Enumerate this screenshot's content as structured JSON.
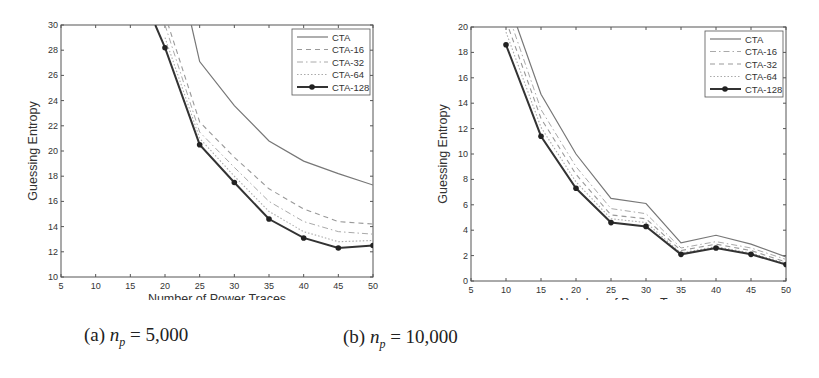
{
  "chart_data": [
    {
      "type": "line",
      "title": "",
      "caption": "(a) n_p = 5,000",
      "xlabel": "Number of Power Traces",
      "ylabel": "Guessing Entropy",
      "xlim": [
        5,
        50
      ],
      "ylim": [
        10,
        30
      ],
      "xticks": [
        5,
        10,
        15,
        20,
        25,
        30,
        35,
        40,
        45,
        50
      ],
      "yticks": [
        10,
        12,
        14,
        16,
        18,
        20,
        22,
        24,
        26,
        28,
        30
      ],
      "grid": false,
      "legend_position": "upper right",
      "x": [
        20,
        25,
        30,
        35,
        40,
        45,
        50
      ],
      "series": [
        {
          "name": "CTA",
          "style": "solid",
          "values": [
            null,
            27.1,
            23.6,
            20.8,
            19.2,
            18.2,
            17.3
          ],
          "entry": [
            23.8,
            30
          ]
        },
        {
          "name": "CTA-16",
          "style": "dashed",
          "values": [
            30.8,
            22.3,
            19.5,
            17.0,
            15.4,
            14.4,
            14.2
          ]
        },
        {
          "name": "CTA-32",
          "style": "dashdot",
          "values": [
            30.0,
            21.5,
            18.7,
            16.0,
            14.4,
            13.6,
            13.4
          ]
        },
        {
          "name": "CTA-64",
          "style": "dotted",
          "values": [
            29.0,
            21.0,
            18.0,
            15.2,
            13.6,
            12.8,
            12.9
          ]
        },
        {
          "name": "CTA-128",
          "style": "solid-marker",
          "values": [
            28.2,
            20.5,
            17.5,
            14.6,
            13.1,
            12.3,
            12.5
          ],
          "entry": [
            18.6,
            30
          ]
        }
      ]
    },
    {
      "type": "line",
      "title": "",
      "caption": "(b) n_p = 10,000",
      "xlabel": "Number of Power Traces",
      "ylabel": "Guessing Entropy",
      "xlim": [
        5,
        50
      ],
      "ylim": [
        0,
        20
      ],
      "xticks": [
        5,
        10,
        15,
        20,
        25,
        30,
        35,
        40,
        45,
        50
      ],
      "yticks": [
        0,
        2,
        4,
        6,
        8,
        10,
        12,
        14,
        16,
        18,
        20
      ],
      "grid": false,
      "legend_position": "upper right",
      "x": [
        10,
        15,
        20,
        25,
        30,
        35,
        40,
        45,
        50
      ],
      "series": [
        {
          "name": "CTA",
          "style": "solid",
          "values": [
            22.5,
            14.7,
            10.0,
            6.5,
            6.1,
            3.0,
            3.6,
            2.9,
            1.9
          ]
        },
        {
          "name": "CTA-16",
          "style": "dashdot",
          "values": [
            21.5,
            13.5,
            9.0,
            5.7,
            5.3,
            2.6,
            3.1,
            2.6,
            1.7
          ]
        },
        {
          "name": "CTA-32",
          "style": "dashed",
          "values": [
            20.5,
            12.8,
            8.4,
            5.2,
            4.9,
            2.4,
            2.9,
            2.4,
            1.5
          ]
        },
        {
          "name": "CTA-64",
          "style": "dotted",
          "values": [
            19.6,
            12.1,
            7.8,
            4.9,
            4.6,
            2.2,
            2.7,
            2.2,
            1.4
          ]
        },
        {
          "name": "CTA-128",
          "style": "solid-marker",
          "values": [
            18.6,
            11.4,
            7.3,
            4.6,
            4.3,
            2.1,
            2.6,
            2.1,
            1.3
          ]
        }
      ]
    }
  ],
  "panels": [
    {
      "caption_prefix": "(a) ",
      "caption_var": "n",
      "caption_sub": "p",
      "caption_rest": " = 5,000"
    },
    {
      "caption_prefix": "(b) ",
      "caption_var": "n",
      "caption_sub": "p",
      "caption_rest": " = 10,000"
    }
  ]
}
